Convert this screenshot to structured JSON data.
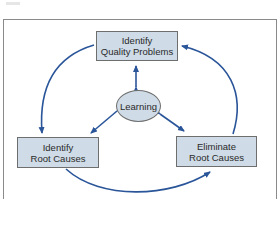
{
  "diagram": {
    "type": "cycle",
    "nodes": [
      {
        "id": "top",
        "line1": "Identify",
        "line2": "Quality Problems",
        "shape": "rectangle"
      },
      {
        "id": "center",
        "label": "Learning",
        "shape": "ellipse"
      },
      {
        "id": "left",
        "line1": "Identify",
        "line2": "Root Causes",
        "shape": "rectangle"
      },
      {
        "id": "right",
        "line1": "Eliminate",
        "line2": "Root Causes",
        "shape": "rectangle"
      }
    ],
    "edges": [
      {
        "from": "top",
        "to": "left",
        "style": "curved-arrow"
      },
      {
        "from": "left",
        "to": "right",
        "style": "curved-arrow"
      },
      {
        "from": "right",
        "to": "top",
        "style": "curved-arrow"
      },
      {
        "from": "center",
        "to": "top",
        "style": "double-arrow"
      },
      {
        "from": "center",
        "to": "left",
        "style": "double-arrow"
      },
      {
        "from": "center",
        "to": "right",
        "style": "double-arrow"
      }
    ],
    "colors": {
      "box_fill": "#cfdbe6",
      "arrow": "#2a5599",
      "border": "#6e6e6e"
    }
  }
}
